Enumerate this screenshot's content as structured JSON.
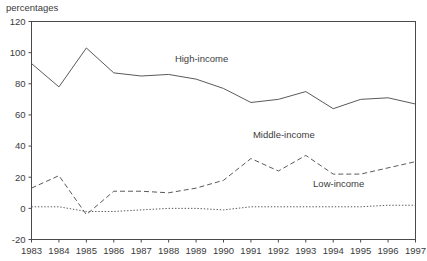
{
  "chart_data": {
    "type": "line",
    "title": "",
    "ylabel": "percentages",
    "xlabel": "",
    "x": [
      1983,
      1984,
      1985,
      1986,
      1987,
      1988,
      1989,
      1990,
      1991,
      1992,
      1993,
      1994,
      1995,
      1996,
      1997
    ],
    "xtick_labels": [
      "1983",
      "1984",
      "1985",
      "1986",
      "1987",
      "1988",
      "1989",
      "1990",
      "1991",
      "1992",
      "1993",
      "1994",
      "1995",
      "1996",
      "1997"
    ],
    "ytick_labels": [
      "120",
      "100",
      "80",
      "60",
      "40",
      "20",
      "0",
      "-20"
    ],
    "yticks": [
      120,
      100,
      80,
      60,
      40,
      20,
      0,
      -20
    ],
    "ylim": [
      -20,
      120
    ],
    "xlim": [
      1983,
      1997
    ],
    "grid": false,
    "legend_position": "inline-annotations",
    "series": [
      {
        "name": "High-income",
        "style": "solid",
        "label_x": 1989.2,
        "label_y": 94,
        "values": [
          93,
          78,
          103,
          87,
          85,
          86,
          83,
          77,
          68,
          70,
          75,
          64,
          70,
          71,
          67
        ]
      },
      {
        "name": "Middle-income",
        "style": "dashed",
        "label_x": 1992.2,
        "label_y": 45,
        "values": [
          13,
          21,
          -4,
          11,
          11,
          10,
          13,
          18,
          32,
          24,
          34,
          22,
          22,
          26,
          30
        ]
      },
      {
        "name": "Low-income",
        "style": "dotted",
        "label_x": 1994.2,
        "label_y": 14,
        "values": [
          1,
          1,
          -2,
          -2,
          -1,
          0,
          0,
          -1,
          1,
          1,
          1,
          1,
          1,
          2,
          2
        ]
      }
    ]
  }
}
